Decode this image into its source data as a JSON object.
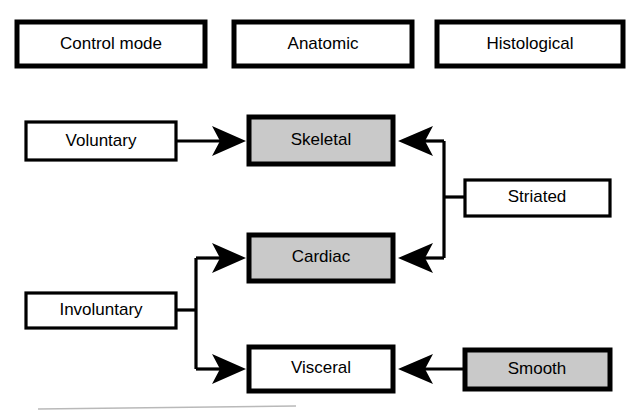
{
  "figure": {
    "colors": {
      "shaded_fill": "#c9c9c9",
      "plain_fill": "#ffffff",
      "stroke": "#000000",
      "artifact": "#b9b9b9"
    }
  },
  "headers": [
    {
      "id": "control-mode",
      "label": "Control mode"
    },
    {
      "id": "anatomic",
      "label": "Anatomic"
    },
    {
      "id": "histological",
      "label": "Histological"
    }
  ],
  "nodes": {
    "voluntary": {
      "label": "Voluntary",
      "fill": "plain",
      "column": "control-mode"
    },
    "involuntary": {
      "label": "Involuntary",
      "fill": "plain",
      "column": "control-mode"
    },
    "skeletal": {
      "label": "Skeletal",
      "fill": "shaded",
      "column": "anatomic"
    },
    "cardiac": {
      "label": "Cardiac",
      "fill": "shaded",
      "column": "anatomic"
    },
    "visceral": {
      "label": "Visceral",
      "fill": "plain",
      "column": "anatomic"
    },
    "striated": {
      "label": "Striated",
      "fill": "plain",
      "column": "histological"
    },
    "smooth": {
      "label": "Smooth",
      "fill": "shaded",
      "column": "histological"
    }
  },
  "edges": [
    {
      "id": "voluntary-to-skeletal",
      "from": "voluntary",
      "to": "skeletal",
      "direction": "right"
    },
    {
      "id": "involuntary-to-cardiac",
      "from": "involuntary",
      "to": "cardiac",
      "direction": "right",
      "bracket": true
    },
    {
      "id": "involuntary-to-visceral",
      "from": "involuntary",
      "to": "visceral",
      "direction": "right",
      "bracket": true
    },
    {
      "id": "striated-to-skeletal",
      "from": "striated",
      "to": "skeletal",
      "direction": "left",
      "bracket": true
    },
    {
      "id": "striated-to-cardiac",
      "from": "striated",
      "to": "cardiac",
      "direction": "left",
      "bracket": true
    },
    {
      "id": "smooth-to-visceral",
      "from": "smooth",
      "to": "visceral",
      "direction": "left"
    }
  ]
}
